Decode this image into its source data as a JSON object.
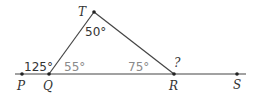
{
  "diagram": {
    "points": {
      "T": {
        "label": "T",
        "x": 94,
        "y": 12
      },
      "P": {
        "label": "P",
        "x": 22,
        "y": 74
      },
      "Q": {
        "label": "Q",
        "x": 49,
        "y": 74
      },
      "R": {
        "label": "R",
        "x": 174,
        "y": 74
      },
      "S": {
        "label": "S",
        "x": 237,
        "y": 74
      }
    },
    "angles": {
      "T_interior": "50°",
      "Q_exterior": "125°",
      "Q_interior": "55°",
      "R_interior": "75°",
      "R_exterior": "?"
    },
    "colors": {
      "line": "#444444",
      "text": "#333333",
      "muted_text": "#8a8a8a"
    }
  }
}
